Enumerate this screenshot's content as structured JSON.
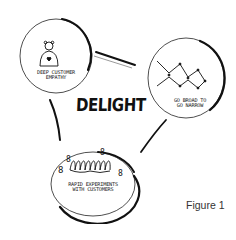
{
  "diagram": {
    "center_label": "DELIGHT",
    "nodes": [
      {
        "id": "empathy",
        "label_line1": "DEEP CUSTOMER",
        "label_line2": "EMPATHY",
        "icon": "person-with-heart-icon"
      },
      {
        "id": "broad-narrow",
        "label_line1": "GO BROAD TO",
        "label_line2": "GO NARROW",
        "icon": "branching-network-icon"
      },
      {
        "id": "experiments",
        "label_line1": "RAPID EXPERIMENTS",
        "label_line2": "WITH CUSTOMERS",
        "icon": "coil-with-people-icon"
      }
    ],
    "edges": [
      {
        "from": "empathy",
        "to": "broad-narrow"
      },
      {
        "from": "broad-narrow",
        "to": "experiments"
      },
      {
        "from": "experiments",
        "to": "empathy"
      }
    ],
    "caption": "Figure 1"
  },
  "colors": {
    "ink": "#111111",
    "background": "#ffffff",
    "caption": "#333333"
  }
}
